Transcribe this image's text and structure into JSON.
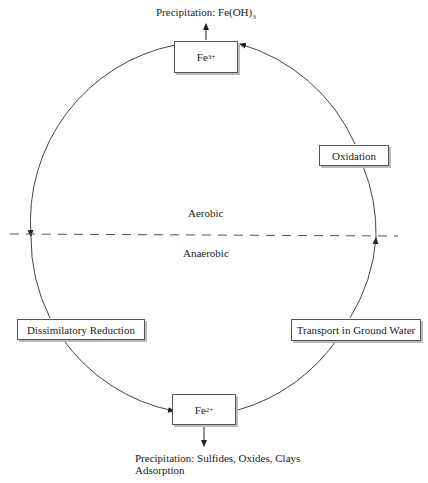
{
  "diagram": {
    "nodes": {
      "fe3": {
        "base": "Fe",
        "charge": "3+"
      },
      "fe2": {
        "base": "Fe",
        "charge": "2+"
      },
      "oxidation": "Oxidation",
      "reduction": "Dissimilatory Reduction",
      "transport": "Transport in Ground Water"
    },
    "zones": {
      "aerobic": "Aerobic",
      "anaerobic": "Anaerobic"
    },
    "outputs": {
      "top": {
        "prefix": "Precipitation: Fe(OH)",
        "sub": "3"
      },
      "bottom_line1": "Precipitation: Sulfides, Oxides, Clays",
      "bottom_line2": "Adsorption"
    },
    "colors": {
      "line": "#444444",
      "dash": "#555555",
      "box_shadow": "#bbbbbb"
    }
  }
}
